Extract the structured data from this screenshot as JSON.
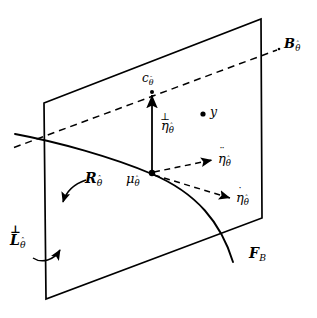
{
  "figure": {
    "type": "geometric-diagram",
    "background_color": "#ffffff",
    "stroke_color": "#000000",
    "width": 317,
    "height": 318
  },
  "labels": {
    "bundle": {
      "base": "B",
      "sub": "θ",
      "accent": "hat",
      "full": "ℬθ̂"
    },
    "center": {
      "base": "c",
      "sub": "θ",
      "accent": "hat",
      "full": "cθ̂"
    },
    "point_y": {
      "base": "y",
      "full": "y"
    },
    "eta_perp": {
      "base": "η",
      "sub": "θ",
      "accent": "perp",
      "full": "⊥ηθ̂"
    },
    "eta_ddot": {
      "base": "η",
      "sub": "θ",
      "accent": "ddot",
      "full": "η̈θ̂"
    },
    "eta_dot": {
      "base": "η",
      "sub": "θ",
      "accent": "dot",
      "full": "η̇θ̂"
    },
    "mu": {
      "base": "μ",
      "sub": "θ",
      "accent": "hat",
      "full": "μθ̂"
    },
    "region_R": {
      "base": "R",
      "sub": "θ",
      "accent": "hat",
      "full": "ℛθ̂"
    },
    "level_L": {
      "base": "L",
      "sub": "θ",
      "accent": "perp",
      "full": "⊥ℒθ̂"
    },
    "fiber_F": {
      "base": "F",
      "sub": "B",
      "full": "ℱB"
    },
    "perp_symbol": "⊥",
    "hat_symbol": "ˆ",
    "dot_symbol": "˙",
    "ddot_symbol": "¨",
    "theta_symbol": "θ"
  },
  "geometry": {
    "plane": {
      "name": "plane-quadrilateral",
      "corners": [
        [
          44,
          103
        ],
        [
          261,
          19
        ],
        [
          262,
          218
        ],
        [
          46,
          299
        ]
      ]
    },
    "curve_fiber": {
      "name": "fiber-curve",
      "path": "M 15,134 C 60,143 112,158 152,174 C 196,192 220,222 233,262"
    },
    "dashed_bundle_line": {
      "name": "bundle-dashed-line",
      "from": [
        14,
        147
      ],
      "to": [
        278,
        50
      ]
    },
    "vector_perp": {
      "from": [
        152,
        173
      ],
      "to": [
        152,
        92
      ],
      "style": "solid"
    },
    "vector_ddot": {
      "from": [
        152,
        173
      ],
      "to": [
        214,
        160
      ],
      "style": "dashed"
    },
    "vector_dot": {
      "from": [
        152,
        173
      ],
      "to": [
        232,
        199
      ],
      "style": "dashed"
    },
    "point_mu": [
      152,
      173
    ],
    "point_c": [
      152,
      92
    ],
    "point_y": [
      203,
      114
    ],
    "arc_R": {
      "name": "curved-arrow-R",
      "from": [
        85,
        180
      ],
      "to": [
        63,
        205
      ]
    },
    "arc_L": {
      "name": "curved-arrow-L",
      "from": [
        35,
        257
      ],
      "to": [
        62,
        248
      ]
    }
  }
}
